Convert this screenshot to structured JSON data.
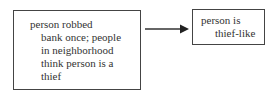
{
  "diagram": {
    "nodes": [
      {
        "id": "cause",
        "lines": [
          "person robbed",
          "bank once; people",
          "in neighborhood",
          "think person is a",
          "thief"
        ]
      },
      {
        "id": "effect",
        "lines": [
          "person is",
          "thief-like"
        ]
      }
    ],
    "edges": [
      {
        "from": "cause",
        "to": "effect"
      }
    ]
  }
}
